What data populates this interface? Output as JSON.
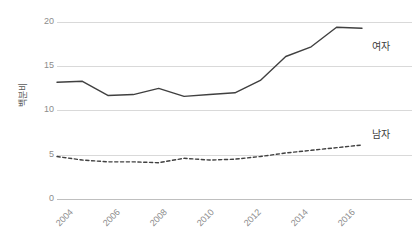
{
  "chart": {
    "axis_title_y": "백분비",
    "y_ticks": [
      "0",
      "5",
      "10",
      "15",
      "20"
    ],
    "x_ticks": [
      "2004",
      "2006",
      "2008",
      "2010",
      "2012",
      "2014",
      "2016"
    ],
    "series_label_female": "여자",
    "series_label_male": "남자"
  },
  "colors": {
    "line": "#404040",
    "grid": "#d9d9d9",
    "axis": "#bfbfbf",
    "tick_text": "#8c8c8c",
    "label_text": "#404040",
    "background": "#ffffff"
  },
  "chart_data": {
    "type": "line",
    "title": "",
    "xlabel": "",
    "ylabel": "백분비",
    "xlim": [
      2004,
      2016
    ],
    "ylim": [
      0,
      20
    ],
    "ytick_values": [
      0,
      5,
      10,
      15,
      20
    ],
    "xtick_values": [
      2004,
      2006,
      2008,
      2010,
      2012,
      2014,
      2016
    ],
    "grid": true,
    "legend": "inline-right",
    "x": [
      2004,
      2005,
      2006,
      2007,
      2008,
      2009,
      2010,
      2011,
      2012,
      2013,
      2014,
      2015,
      2016
    ],
    "series": [
      {
        "name": "여자",
        "style": "solid",
        "values": [
          13.2,
          13.3,
          11.7,
          11.8,
          12.5,
          11.6,
          11.8,
          12.0,
          13.4,
          16.1,
          17.2,
          19.4,
          19.3
        ]
      },
      {
        "name": "남자",
        "style": "dashed",
        "values": [
          4.8,
          4.4,
          4.2,
          4.2,
          4.1,
          4.6,
          4.4,
          4.5,
          4.8,
          5.2,
          5.5,
          5.8,
          6.1
        ]
      }
    ]
  }
}
